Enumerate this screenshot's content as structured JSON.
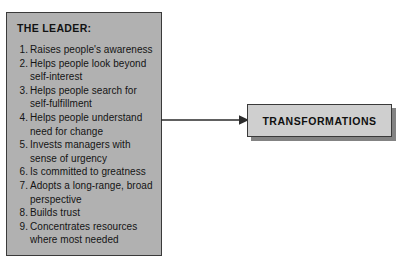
{
  "diagram": {
    "type": "flow",
    "colors": {
      "leader_box_fill": "#b1b1b1",
      "transformations_box_fill": "#cfcfcf",
      "box_border": "#3a3a3a",
      "shadow": "#838383",
      "text": "#141414",
      "background": "#ffffff"
    },
    "leader_box": {
      "title": "THE LEADER:",
      "items": [
        {
          "number": "1.",
          "text": "Raises people's awareness"
        },
        {
          "number": "2.",
          "text": "Helps people look beyond self-interest"
        },
        {
          "number": "3.",
          "text": "Helps people search for self-fulfillment"
        },
        {
          "number": "4.",
          "text": "Helps people understand need for change"
        },
        {
          "number": "5.",
          "text": "Invests managers with sense of urgency"
        },
        {
          "number": "6.",
          "text": "Is committed to greatness"
        },
        {
          "number": "7.",
          "text": "Adopts a long-range, broad perspective"
        },
        {
          "number": "8.",
          "text": "Builds trust"
        },
        {
          "number": "9.",
          "text": "Concentrates resources where most needed"
        }
      ]
    },
    "arrow": {
      "label": "",
      "direction": "right",
      "from": "THE LEADER:",
      "to": "TRANSFORMATIONS"
    },
    "transformations_box": {
      "label": "TRANSFORMATIONS"
    }
  }
}
